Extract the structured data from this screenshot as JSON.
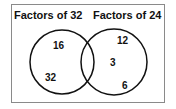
{
  "diagram": {
    "type": "venn",
    "sets": [
      {
        "label": "Factors of 32",
        "only": [
          "16",
          "32"
        ]
      },
      {
        "label": "Factors of 24",
        "only": [
          "12",
          "3",
          "6"
        ]
      }
    ],
    "intersection": []
  },
  "labels": {
    "left": "Factors of 32",
    "right": "Factors of 24"
  },
  "values": {
    "a": "16",
    "b": "32",
    "c": "12",
    "d": "3",
    "e": "6"
  }
}
